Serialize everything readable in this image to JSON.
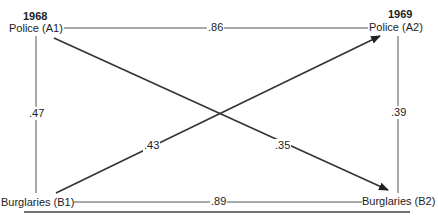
{
  "diagram": {
    "title_left_year": "1968",
    "title_right_year": "1969",
    "nodes": {
      "A1": "Police (A1)",
      "A2": "Police (A2)",
      "B1": "Burglaries (B1)",
      "B2": "Burglaries (B2)"
    },
    "paths": {
      "A1_A2": ".86",
      "B1_B2": ".89",
      "A1_B1": ".47",
      "A2_B2": ".39",
      "B1_A2": ".43",
      "A1_B2": ".35"
    },
    "line_color": "#333333"
  }
}
